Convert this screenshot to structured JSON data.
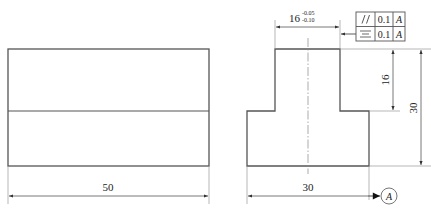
{
  "drawing": {
    "colors": {
      "line": "#555555",
      "thin": "#888888",
      "text": "#222222"
    },
    "left_view": {
      "dimensions": {
        "width_label": "50"
      }
    },
    "right_view": {
      "dimensions": {
        "top_width_label": "16",
        "top_width_upper_tol": "-0.05",
        "top_width_lower_tol": "-0.10",
        "step_height_label": "16",
        "total_height_label": "30",
        "base_width_label": "30"
      },
      "feature_control_frames": [
        {
          "symbol": "parallelism-icon",
          "symbol_text": "//",
          "tolerance": "0.1",
          "datum": "A"
        },
        {
          "symbol": "symmetry-icon",
          "symbol_text": "≡",
          "tolerance": "0.1",
          "datum": "A"
        }
      ],
      "datum": {
        "label": "A"
      }
    }
  }
}
